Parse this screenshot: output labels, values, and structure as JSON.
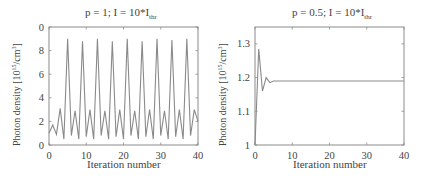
{
  "chart_data": [
    {
      "type": "line",
      "title": "p = 1; I = 10*I_thr",
      "title_main": "p = 1; I = 10*I",
      "title_sub": "thr",
      "xlabel": "Iteration number",
      "ylabel": "Photon density [10^15/cm^3]",
      "ylabel_main": "Photon density [10",
      "ylabel_exp1": "15",
      "ylabel_mid": "/cm",
      "ylabel_exp2": "3",
      "ylabel_end": "]",
      "xlim": [
        0,
        40
      ],
      "ylim": [
        0,
        10
      ],
      "xticks": [
        0,
        10,
        20,
        30,
        40
      ],
      "yticks": [
        0,
        2,
        4,
        6,
        8,
        10
      ],
      "ytick_labels": [
        "0",
        "2",
        "4",
        "6",
        "8",
        "0"
      ],
      "grid": false,
      "line_color": "#8a8a8a",
      "x": [
        0,
        1,
        2,
        3,
        4,
        5,
        6,
        7,
        8,
        9,
        10,
        11,
        12,
        13,
        14,
        15,
        16,
        17,
        18,
        19,
        20,
        21,
        22,
        23,
        24,
        25,
        26,
        27,
        28,
        29,
        30,
        31,
        32,
        33,
        34,
        35,
        36,
        37,
        38,
        39,
        40
      ],
      "y": [
        1.0,
        1.7,
        0.9,
        3.1,
        0.5,
        9.0,
        0.8,
        2.9,
        0.5,
        8.8,
        0.7,
        3.0,
        0.5,
        9.0,
        0.8,
        2.9,
        0.5,
        8.8,
        0.7,
        3.0,
        0.5,
        9.0,
        0.8,
        2.9,
        0.5,
        8.8,
        0.7,
        3.0,
        0.5,
        9.0,
        0.8,
        2.9,
        0.5,
        8.9,
        0.7,
        3.0,
        0.5,
        9.0,
        0.8,
        3.0,
        2.0
      ]
    },
    {
      "type": "line",
      "title": "p = 0.5; I = 10*I_thr",
      "title_main": "p = 0.5; I = 10*I",
      "title_sub": "thr",
      "xlabel": "Iteration number",
      "ylabel": "Photon density [10^15/cm^3]",
      "ylabel_main": "Photon density [10",
      "ylabel_exp1": "15",
      "ylabel_mid": "/cm",
      "ylabel_exp2": "3",
      "ylabel_end": "]",
      "xlim": [
        0,
        40
      ],
      "ylim": [
        1,
        1.35
      ],
      "xticks": [
        0,
        10,
        20,
        30,
        40
      ],
      "yticks": [
        1,
        1.1,
        1.2,
        1.3
      ],
      "ytick_labels": [
        "1",
        "1.1",
        "1.2",
        "1.3"
      ],
      "grid": false,
      "line_color": "#8a8a8a",
      "x": [
        0,
        1,
        2,
        3,
        4,
        5,
        6,
        7,
        8,
        9,
        10,
        15,
        20,
        25,
        30,
        35,
        40
      ],
      "y": [
        1.0,
        1.285,
        1.16,
        1.2,
        1.185,
        1.19,
        1.19,
        1.19,
        1.19,
        1.19,
        1.19,
        1.19,
        1.19,
        1.19,
        1.19,
        1.19,
        1.19
      ]
    }
  ]
}
